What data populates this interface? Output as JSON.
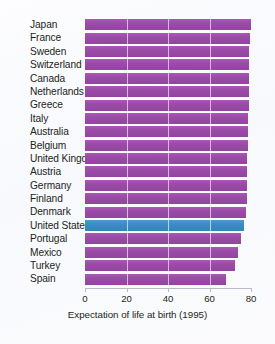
{
  "chart_data": {
    "type": "bar",
    "orientation": "horizontal",
    "title": "",
    "xlabel": "Expectation of life at birth (1995)",
    "ylabel": "",
    "xlim": [
      0,
      80
    ],
    "xticks": [
      0,
      20,
      40,
      60,
      80
    ],
    "xtick_labels": [
      "0",
      "20",
      "40",
      "60",
      "80"
    ],
    "grid": true,
    "grid_axis": "x",
    "legend": "none",
    "bar_color": "#9b4ca8",
    "highlight_color": "#3a8cc4",
    "highlight_category": "United States",
    "categories": [
      "Japan",
      "France",
      "Sweden",
      "Switzerland",
      "Canada",
      "Netherlands",
      "Greece",
      "Italy",
      "Australia",
      "Belgium",
      "United Kingdom",
      "Austria",
      "Germany",
      "Finland",
      "Denmark",
      "United States",
      "Portugal",
      "Mexico",
      "Turkey",
      "Spain"
    ],
    "values": [
      79.9,
      79.4,
      79.2,
      79.1,
      79.0,
      78.9,
      78.8,
      78.7,
      78.6,
      78.4,
      78.3,
      78.2,
      78.1,
      78.0,
      77.8,
      76.5,
      75.4,
      73.6,
      72.2,
      68.0
    ]
  }
}
